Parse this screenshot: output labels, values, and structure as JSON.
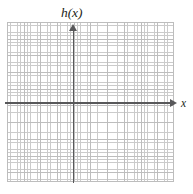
{
  "figure": {
    "kind": "cartesian-coordinate-grid",
    "width": 193,
    "height": 194,
    "background_color": "#ffffff"
  },
  "labels": {
    "y_axis_label": "h(x)",
    "x_axis_label": "x"
  },
  "axes": {
    "x_axis_name": "x-axis",
    "y_axis_name": "h(x)-axis",
    "origin_px": "73,103",
    "axis_color": "#58585a",
    "x_arrow_direction": "right",
    "y_arrow_direction": "up"
  },
  "grid": {
    "major_color": "#bdbdbd",
    "minor_color": "#c9c9c9",
    "major_spacing_px": 16.7,
    "minor_spacing_px": 3.34,
    "major_columns": 10,
    "major_rows": 10,
    "grid_left_px": 7,
    "grid_top_px": 22,
    "grid_width_px": 167,
    "grid_height_px": 160,
    "minor_visible": "true",
    "major_visible": "true"
  },
  "chart_data": {
    "type": "line",
    "title": "",
    "subtitle": "",
    "xlabel": "x",
    "ylabel": "h(x)",
    "xlim": [
      -4.4,
      6.1
    ],
    "ylim": [
      -4.7,
      4.9
    ],
    "xticks": [
      -4,
      -3,
      -2,
      -1,
      0,
      1,
      2,
      3,
      4,
      5,
      6
    ],
    "yticks": [
      -4,
      -3,
      -2,
      -1,
      0,
      1,
      2,
      3,
      4
    ],
    "xticklabels": [
      "",
      "",
      "",
      "",
      "",
      "",
      "",
      "",
      "",
      "",
      ""
    ],
    "yticklabels": [
      "",
      "",
      "",
      "",
      "",
      "",
      "",
      "",
      ""
    ],
    "grid": "true",
    "minor_grid": "true",
    "legend": "none",
    "series": [],
    "annotations": [],
    "note": "Blank graph paper: axes drawn with arrowheads, no data plotted."
  }
}
